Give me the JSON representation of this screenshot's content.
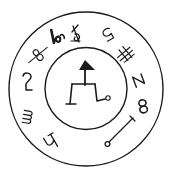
{
  "figure": {
    "title": "Seal / sigil diagram",
    "colors": {
      "ink": "#1a1a1a",
      "background": "#ffffff"
    },
    "outer_circle": {
      "cx": 86,
      "cy": 89,
      "r": 77
    },
    "inner_circle": {
      "cx": 86,
      "cy": 88.5,
      "r": 41
    },
    "ring_glyphs": [
      {
        "id": "g1",
        "label": "8 (crossed)",
        "x": 38,
        "y": 55,
        "rotate": -40
      },
      {
        "id": "g2",
        "label": "lo",
        "x": 57,
        "y": 38,
        "rotate": -15
      },
      {
        "id": "g3",
        "label": "R",
        "x": 76,
        "y": 34,
        "rotate": 170
      },
      {
        "id": "g4",
        "label": "5",
        "x": 108,
        "y": 34,
        "rotate": 150
      },
      {
        "id": "g5",
        "label": "卄",
        "x": 125,
        "y": 53,
        "rotate": -40
      },
      {
        "id": "g6",
        "label": "Z",
        "x": 139,
        "y": 80,
        "rotate": 70
      },
      {
        "id": "g7",
        "label": "8",
        "x": 143,
        "y": 106,
        "rotate": 80
      },
      {
        "id": "g8",
        "label": "staff with ring",
        "x": 118,
        "y": 132,
        "rotate": 0
      },
      {
        "id": "g9",
        "label": "2",
        "x": 27,
        "y": 82,
        "rotate": 0
      },
      {
        "id": "g10",
        "label": "m",
        "x": 27,
        "y": 118,
        "rotate": 100
      },
      {
        "id": "g11",
        "label": "h",
        "x": 51,
        "y": 141,
        "rotate": 150
      }
    ],
    "central_sigil": {
      "label": "arrow-topped figure with legs",
      "triangle": "85,60 79,70 95,70",
      "stem": "85,70 85,85",
      "bar": "72,84 95,84",
      "left_leg": "72,84 70,104",
      "left_foot": "66,104 76,104",
      "right_leg": "95,84 97,101 105,99",
      "end_ring": {
        "cx": 108,
        "cy": 98,
        "r": 2
      }
    }
  }
}
